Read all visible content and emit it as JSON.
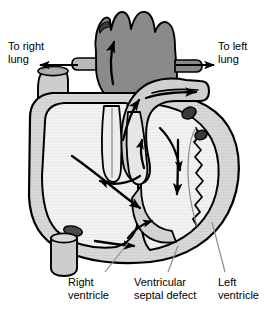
{
  "figure": {
    "labels": {
      "to_right_lung": "To right\nlung",
      "to_left_lung": "To left\nlung",
      "right_ventricle": "Right\nventricle",
      "ventricular_septal_defect": "Ventricular\nseptal defect",
      "left_ventricle": "Left\nventricle"
    },
    "colors": {
      "background": "#ffffff",
      "outline": "#000000",
      "pulmonary_trunk": "#8a8a8a",
      "aorta": "#cfcfcf",
      "myocardium": "#d8d8d8",
      "chamber": "#f2f2f2",
      "vessel_wall": "#9a9a9a",
      "vena_cava": "#cdcdcd",
      "coronary_spot": "#3a3a3a",
      "leader_line": "#8c8c8c",
      "flow_arrow": "#000000"
    }
  }
}
